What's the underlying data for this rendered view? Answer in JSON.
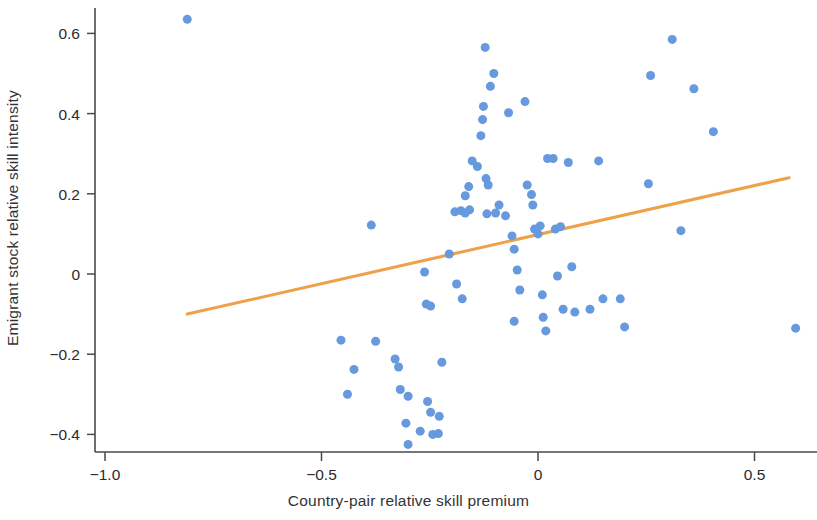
{
  "chart_data": {
    "type": "scatter",
    "title": "",
    "xlabel": "Country-pair relative skill premium",
    "ylabel": "Emigrant stock relative skill intensity",
    "xlim": [
      -1.08,
      0.66
    ],
    "ylim": [
      -0.47,
      0.67
    ],
    "xticks": [
      -1.0,
      -0.5,
      0,
      0.5
    ],
    "xtick_labels": [
      "−1.0",
      "−0.5",
      "0",
      "0.5"
    ],
    "yticks": [
      -0.4,
      -0.2,
      0,
      0.2,
      0.4,
      0.6
    ],
    "ytick_labels": [
      "−0.4",
      "−0.2",
      "0",
      "0.2",
      "0.4",
      "0.6"
    ],
    "grid": false,
    "legend": "none",
    "marker_color": "#6699dd",
    "marker_size": 9,
    "trend_color": "#efa14a",
    "trendline": {
      "type": "linear",
      "x": [
        -0.81,
        0.58
      ],
      "y": [
        -0.1,
        0.24
      ],
      "slope": 0.2446,
      "intercept": 0.0981
    },
    "points": [
      {
        "x": -0.81,
        "y": 0.635
      },
      {
        "x": -0.385,
        "y": 0.122
      },
      {
        "x": -0.455,
        "y": -0.165
      },
      {
        "x": -0.425,
        "y": -0.238
      },
      {
        "x": -0.44,
        "y": -0.3
      },
      {
        "x": -0.375,
        "y": -0.168
      },
      {
        "x": -0.33,
        "y": -0.212
      },
      {
        "x": -0.322,
        "y": -0.232
      },
      {
        "x": -0.318,
        "y": -0.288
      },
      {
        "x": -0.3,
        "y": -0.305
      },
      {
        "x": -0.305,
        "y": -0.372
      },
      {
        "x": -0.3,
        "y": -0.425
      },
      {
        "x": -0.272,
        "y": -0.392
      },
      {
        "x": -0.255,
        "y": -0.318
      },
      {
        "x": -0.248,
        "y": -0.345
      },
      {
        "x": -0.243,
        "y": -0.4
      },
      {
        "x": -0.23,
        "y": -0.398
      },
      {
        "x": -0.228,
        "y": -0.355
      },
      {
        "x": -0.222,
        "y": -0.22
      },
      {
        "x": -0.258,
        "y": -0.075
      },
      {
        "x": -0.248,
        "y": -0.08
      },
      {
        "x": -0.262,
        "y": 0.005
      },
      {
        "x": -0.205,
        "y": 0.05
      },
      {
        "x": -0.188,
        "y": -0.025
      },
      {
        "x": -0.175,
        "y": -0.062
      },
      {
        "x": -0.192,
        "y": 0.155
      },
      {
        "x": -0.178,
        "y": 0.158
      },
      {
        "x": -0.168,
        "y": 0.152
      },
      {
        "x": -0.158,
        "y": 0.16
      },
      {
        "x": -0.168,
        "y": 0.195
      },
      {
        "x": -0.16,
        "y": 0.218
      },
      {
        "x": -0.152,
        "y": 0.282
      },
      {
        "x": -0.14,
        "y": 0.268
      },
      {
        "x": -0.132,
        "y": 0.345
      },
      {
        "x": -0.128,
        "y": 0.385
      },
      {
        "x": -0.126,
        "y": 0.418
      },
      {
        "x": -0.12,
        "y": 0.238
      },
      {
        "x": -0.115,
        "y": 0.222
      },
      {
        "x": -0.122,
        "y": 0.565
      },
      {
        "x": -0.11,
        "y": 0.468
      },
      {
        "x": -0.102,
        "y": 0.5
      },
      {
        "x": -0.118,
        "y": 0.15
      },
      {
        "x": -0.098,
        "y": 0.152
      },
      {
        "x": -0.09,
        "y": 0.172
      },
      {
        "x": -0.075,
        "y": 0.145
      },
      {
        "x": -0.068,
        "y": 0.402
      },
      {
        "x": -0.06,
        "y": 0.095
      },
      {
        "x": -0.055,
        "y": 0.062
      },
      {
        "x": -0.048,
        "y": 0.01
      },
      {
        "x": -0.042,
        "y": -0.04
      },
      {
        "x": -0.055,
        "y": -0.118
      },
      {
        "x": -0.03,
        "y": 0.43
      },
      {
        "x": -0.025,
        "y": 0.222
      },
      {
        "x": -0.015,
        "y": 0.198
      },
      {
        "x": -0.012,
        "y": 0.172
      },
      {
        "x": -0.008,
        "y": 0.112
      },
      {
        "x": 0.0,
        "y": 0.1
      },
      {
        "x": 0.005,
        "y": 0.12
      },
      {
        "x": 0.01,
        "y": -0.052
      },
      {
        "x": 0.012,
        "y": -0.108
      },
      {
        "x": 0.018,
        "y": -0.142
      },
      {
        "x": 0.022,
        "y": 0.288
      },
      {
        "x": 0.035,
        "y": 0.288
      },
      {
        "x": 0.04,
        "y": 0.112
      },
      {
        "x": 0.052,
        "y": 0.118
      },
      {
        "x": 0.045,
        "y": -0.005
      },
      {
        "x": 0.058,
        "y": -0.088
      },
      {
        "x": 0.07,
        "y": 0.278
      },
      {
        "x": 0.078,
        "y": 0.018
      },
      {
        "x": 0.085,
        "y": -0.095
      },
      {
        "x": 0.12,
        "y": -0.088
      },
      {
        "x": 0.14,
        "y": 0.282
      },
      {
        "x": 0.15,
        "y": -0.062
      },
      {
        "x": 0.19,
        "y": -0.062
      },
      {
        "x": 0.2,
        "y": -0.132
      },
      {
        "x": 0.255,
        "y": 0.225
      },
      {
        "x": 0.26,
        "y": 0.495
      },
      {
        "x": 0.31,
        "y": 0.585
      },
      {
        "x": 0.33,
        "y": 0.108
      },
      {
        "x": 0.36,
        "y": 0.462
      },
      {
        "x": 0.405,
        "y": 0.355
      },
      {
        "x": 0.595,
        "y": -0.135
      }
    ]
  }
}
